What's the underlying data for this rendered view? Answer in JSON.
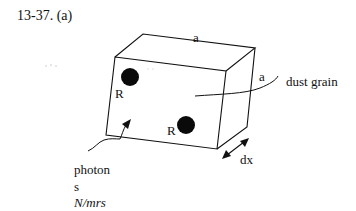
{
  "problem": {
    "number": "13-37.",
    "part": "(a)"
  },
  "diagram": {
    "object_label": "dust grain",
    "edge_label_top": "a",
    "edge_label_side": "a",
    "thickness_label": "dx",
    "particles": [
      {
        "label": "R",
        "position": "upper-left"
      },
      {
        "label": "R",
        "position": "lower-right"
      }
    ],
    "incident_label_line1": "photon",
    "incident_label_line2": "s",
    "flux_label": "N/mrs"
  },
  "colors": {
    "stroke": "#111111",
    "particle_fill": "#0a0a0a",
    "background": "#ffffff"
  }
}
